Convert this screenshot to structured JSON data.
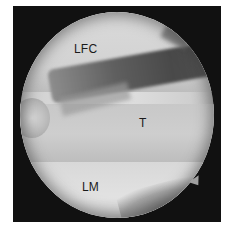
{
  "image": {
    "type": "arthroscopic-view",
    "colormode": "grayscale",
    "labels": [
      {
        "id": "lfc",
        "text": "LFC"
      },
      {
        "id": "t",
        "text": "T"
      },
      {
        "id": "lm",
        "text": "LM"
      }
    ]
  },
  "colors": {
    "frame": "#111111",
    "label": "#1a1a1a",
    "background": "#ffffff"
  }
}
